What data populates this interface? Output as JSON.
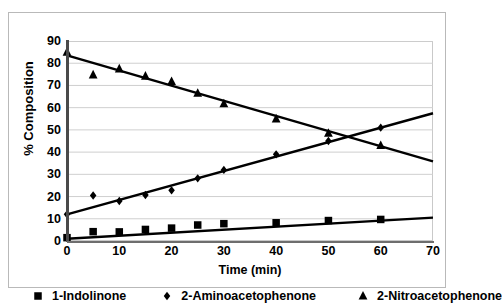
{
  "chart_data": {
    "type": "scatter",
    "title": "",
    "xlabel": "Time (min)",
    "ylabel": "% Composition",
    "xlim": [
      0,
      70
    ],
    "ylim": [
      0,
      90
    ],
    "xticks": [
      0,
      10,
      20,
      30,
      40,
      50,
      60,
      70
    ],
    "yticks": [
      0,
      10,
      20,
      30,
      40,
      50,
      60,
      70,
      80,
      90
    ],
    "grid": "horizontal",
    "legend_position": "bottom",
    "series": [
      {
        "name": "1-Indolinone",
        "marker": "square",
        "color": "#000000",
        "x": [
          0,
          5,
          10,
          15,
          20,
          25,
          30,
          40,
          50,
          60
        ],
        "values": [
          1.5,
          4.2,
          4.1,
          5.2,
          5.8,
          7.2,
          7.8,
          8.2,
          9.2,
          9.7
        ],
        "trendline": {
          "x": [
            0,
            70
          ],
          "y": [
            1.0,
            10.5
          ]
        }
      },
      {
        "name": "2-Aminoacetophenone",
        "marker": "diamond",
        "color": "#000000",
        "x": [
          0,
          5,
          10,
          15,
          20,
          25,
          30,
          40,
          50,
          60
        ],
        "values": [
          12.0,
          20.5,
          18.0,
          20.7,
          22.8,
          28.2,
          32.0,
          39.0,
          45.0,
          51.0
        ],
        "trendline": {
          "x": [
            0,
            70
          ],
          "y": [
            12.0,
            57.5
          ]
        }
      },
      {
        "name": "2-Nitroacetophenone",
        "marker": "triangle",
        "color": "#000000",
        "x": [
          0,
          5,
          10,
          15,
          20,
          25,
          30,
          40,
          50,
          60
        ],
        "values": [
          85.0,
          74.8,
          77.5,
          74.2,
          71.8,
          66.5,
          61.8,
          55.0,
          48.5,
          43.0
        ],
        "trendline": {
          "x": [
            0,
            70
          ],
          "y": [
            83.5,
            35.8
          ]
        }
      }
    ]
  },
  "axes": {
    "x_label": "Time (min)",
    "y_label": "% Composition",
    "x_tick_labels": [
      "0",
      "10",
      "20",
      "30",
      "40",
      "50",
      "60",
      "70"
    ],
    "y_tick_labels": [
      "0",
      "10",
      "20",
      "30",
      "40",
      "50",
      "60",
      "70",
      "80",
      "90"
    ]
  },
  "legend": {
    "items": [
      {
        "label": "1-Indolinone",
        "marker": "square-marker-icon"
      },
      {
        "label": "2-Aminoacetophenone",
        "marker": "diamond-marker-icon"
      },
      {
        "label": "2-Nitroacetophenone",
        "marker": "triangle-marker-icon"
      }
    ]
  },
  "colors": {
    "series": "#000000",
    "grid": "#cfcfcf",
    "axis": "#4a4a4a",
    "frame": "#b9b9b9",
    "background": "#ffffff"
  }
}
